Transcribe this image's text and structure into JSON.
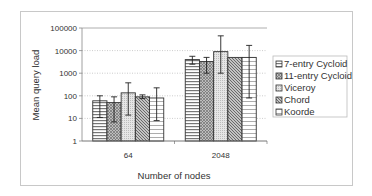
{
  "chart_data": {
    "type": "bar",
    "title": "",
    "xlabel": "Number of nodes",
    "ylabel": "Mean query load",
    "yscale": "log",
    "ylim": [
      1,
      100000
    ],
    "yticks": [
      "1",
      "10",
      "100",
      "1000",
      "10000",
      "100000"
    ],
    "grid": true,
    "legend_position": "right",
    "categories": [
      "64",
      "2048"
    ],
    "series": [
      {
        "name": "7-entry Cycloid",
        "pattern": "horizontal-lines",
        "values": [
          60,
          4000
        ],
        "error_low": [
          11,
          2500
        ],
        "error_high": [
          100,
          5600
        ]
      },
      {
        "name": "11-entry Cycloid",
        "pattern": "crosshatch",
        "values": [
          50,
          3300
        ],
        "error_low": [
          7,
          1000
        ],
        "error_high": [
          90,
          5000
        ]
      },
      {
        "name": "Viceroy",
        "pattern": "light-dots",
        "values": [
          135,
          9000
        ],
        "error_low": [
          14,
          1000
        ],
        "error_high": [
          375,
          45000
        ]
      },
      {
        "name": "Chord",
        "pattern": "diagonal",
        "values": [
          90,
          5000
        ],
        "error_low": [
          75,
          5000
        ],
        "error_high": [
          110,
          5000
        ]
      },
      {
        "name": "Koorde",
        "pattern": "zigzag",
        "values": [
          80,
          5000
        ],
        "error_low": [
          8,
          80
        ],
        "error_high": [
          225,
          17000
        ]
      }
    ]
  }
}
